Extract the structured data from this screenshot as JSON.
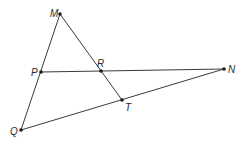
{
  "diagram": {
    "type": "geometry",
    "points": [
      {
        "name": "M",
        "x": 60,
        "y": 14,
        "lx": 50,
        "ly": 14
      },
      {
        "name": "P",
        "x": 41,
        "y": 72,
        "lx": 30,
        "ly": 75
      },
      {
        "name": "R",
        "x": 101,
        "y": 71,
        "lx": 99,
        "ly": 66
      },
      {
        "name": "N",
        "x": 224,
        "y": 69,
        "lx": 229,
        "ly": 72
      },
      {
        "name": "T",
        "x": 122,
        "y": 100,
        "lx": 125,
        "ly": 110
      },
      {
        "name": "Q",
        "x": 21,
        "y": 130,
        "lx": 11,
        "ly": 134
      }
    ],
    "segments": [
      {
        "from": "M",
        "to": "Q"
      },
      {
        "from": "M",
        "to": "T"
      },
      {
        "from": "P",
        "to": "N"
      },
      {
        "from": "Q",
        "to": "N"
      }
    ],
    "labels": {
      "M": "M",
      "P": "P",
      "R": "R",
      "N": "N",
      "T": "T",
      "Q": "Q"
    }
  }
}
